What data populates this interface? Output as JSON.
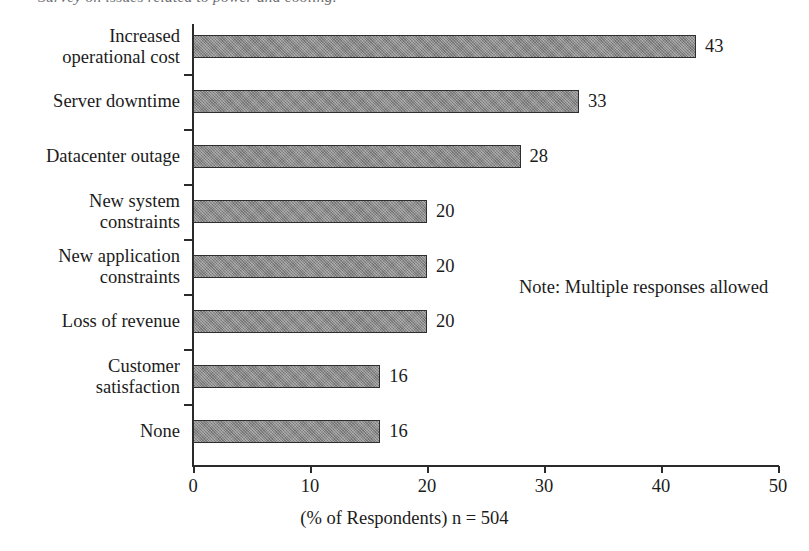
{
  "caption": {
    "text": "Survey on issues related to power and cooling.",
    "clipped": true
  },
  "chart_data": {
    "type": "bar",
    "orientation": "horizontal",
    "title": "",
    "xlabel": "(% of Respondents) n = 504",
    "ylabel": "",
    "xlim": [
      0,
      50
    ],
    "xticks": [
      0,
      10,
      20,
      30,
      40,
      50
    ],
    "grid": false,
    "legend": false,
    "annotation": "Note: Multiple responses allowed",
    "categories": [
      "Increased\noperational cost",
      "Server downtime",
      "Datacenter outage",
      "New system\nconstraints",
      "New application\nconstraints",
      "Loss of revenue",
      "Customer\nsatisfaction",
      "None"
    ],
    "values": [
      43,
      33,
      28,
      20,
      20,
      20,
      16,
      16
    ],
    "value_labels": [
      "43",
      "33",
      "28",
      "20",
      "20",
      "20",
      "16",
      "16"
    ],
    "bar_color": "#8b8b8b",
    "bar_edge_color": "#2e2e2e",
    "axis_color": "#2b2b2b"
  }
}
